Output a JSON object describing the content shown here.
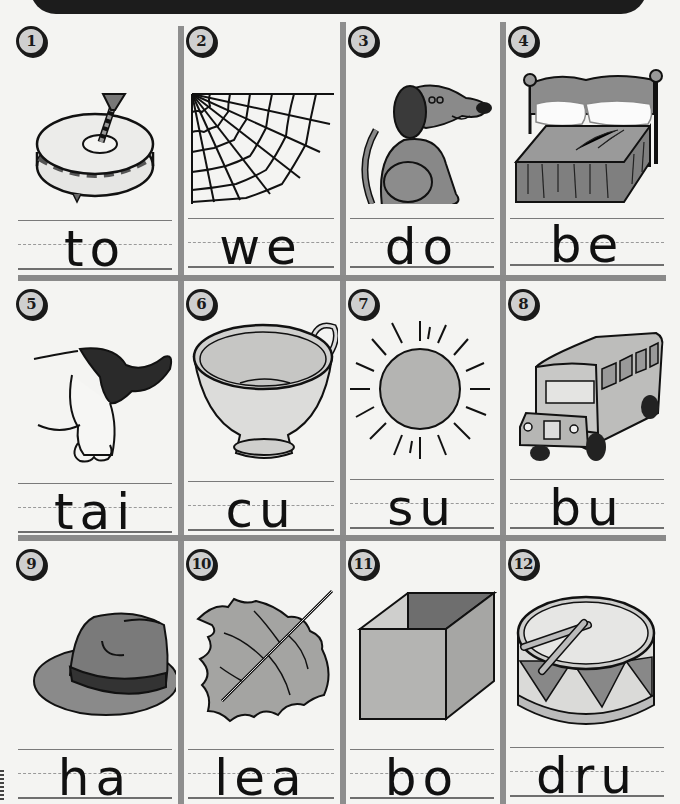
{
  "worksheet": {
    "items": [
      {
        "number": "1",
        "picture": "spinning-top",
        "word": "to"
      },
      {
        "number": "2",
        "picture": "spider-web",
        "word": "we"
      },
      {
        "number": "3",
        "picture": "dog",
        "word": "do"
      },
      {
        "number": "4",
        "picture": "bed",
        "word": "be"
      },
      {
        "number": "5",
        "picture": "dog-tail",
        "word": "tai"
      },
      {
        "number": "6",
        "picture": "cup",
        "word": "cu"
      },
      {
        "number": "7",
        "picture": "sun",
        "word": "su"
      },
      {
        "number": "8",
        "picture": "bus",
        "word": "bu"
      },
      {
        "number": "9",
        "picture": "hat",
        "word": "ha"
      },
      {
        "number": "10",
        "picture": "leaf",
        "word": "lea"
      },
      {
        "number": "11",
        "picture": "box",
        "word": "bo"
      },
      {
        "number": "12",
        "picture": "drum",
        "word": "dru"
      }
    ]
  },
  "colors": {
    "banner": "#1c1c1c",
    "grid": "#8e8e8e",
    "paper": "#f4f4f2",
    "ink": "#111111"
  }
}
